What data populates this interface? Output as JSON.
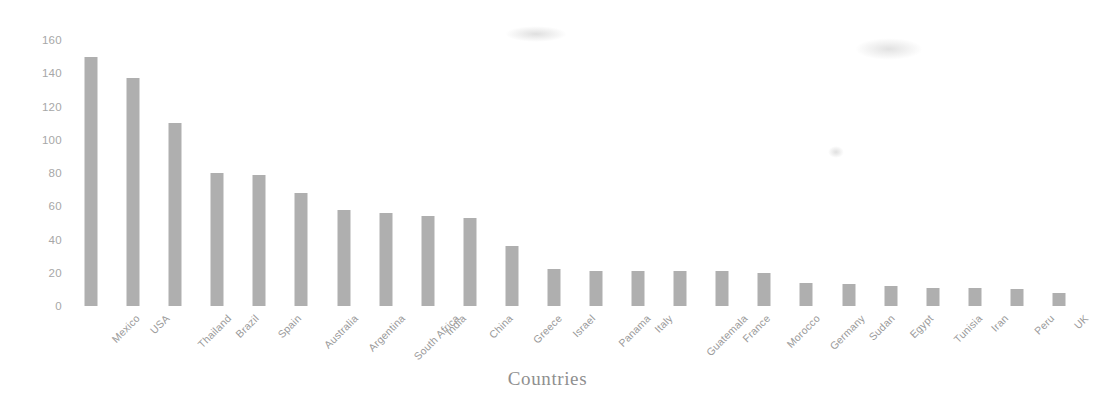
{
  "chart_data": {
    "type": "bar",
    "title": "",
    "xlabel": "Countries",
    "ylabel": "",
    "categories": [
      "Mexico",
      "USA",
      "Thailand",
      "Brazil",
      "Spain",
      "Australia",
      "Argentina",
      "South Africa",
      "India",
      "China",
      "Greece",
      "Israel",
      "Panama",
      "Italy",
      "Guatemala",
      "France",
      "Morocco",
      "Germany",
      "Sudan",
      "Egypt",
      "Tunisia",
      "Iran",
      "Peru",
      "UK"
    ],
    "values": [
      150,
      137,
      110,
      80,
      79,
      68,
      58,
      56,
      54,
      53,
      36,
      22,
      21,
      21,
      21,
      21,
      20,
      14,
      13,
      12,
      11,
      11,
      10,
      8
    ],
    "ylim": [
      0,
      160
    ],
    "ytick_labels": [
      "0",
      "20",
      "40",
      "60",
      "80",
      "100",
      "120",
      "140",
      "160"
    ],
    "ytick_values": [
      0,
      20,
      40,
      60,
      80,
      100,
      120,
      140,
      160
    ],
    "grid": false,
    "legend": "none",
    "bar_color": "#9d9d9d",
    "axis_text_color": "#9a9a9a"
  }
}
